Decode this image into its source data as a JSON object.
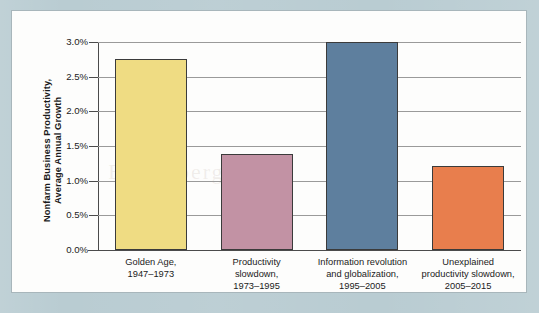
{
  "chart_data": {
    "type": "bar",
    "title": "",
    "xlabel": "",
    "ylabel": "Nonfarm Business Productivity, Average Annual Growth",
    "ylabel_lines": [
      "Nonfarm Business Productivity,",
      "Average Annual Growth"
    ],
    "categories": [
      "Golden Age, 1947–1973",
      "Productivity slowdown, 1973–1995",
      "Information revolution and globalization, 1995–2005",
      "Unexplained productivity slowdown, 2005–2015"
    ],
    "category_lines": [
      [
        "Golden Age,",
        "1947–1973"
      ],
      [
        "Productivity",
        "slowdown,",
        "1973–1995"
      ],
      [
        "Information revolution",
        "and globalization,",
        "1995–2005"
      ],
      [
        "Unexplained",
        "productivity slowdown,",
        "2005–2015"
      ]
    ],
    "values": [
      2.75,
      1.38,
      3.0,
      1.21
    ],
    "value_unit": "%",
    "ylim": [
      0.0,
      3.0
    ],
    "ytick_values": [
      0.0,
      0.5,
      1.0,
      1.5,
      2.0,
      2.5,
      3.0
    ],
    "ytick_labels": [
      "0.0%",
      "0.5%",
      "1.0%",
      "1.5%",
      "2.0%",
      "2.5%",
      "3.0%"
    ],
    "grid": true,
    "legend": false,
    "bar_colors": [
      "#efdc83",
      "#c292a4",
      "#5e7f9e",
      "#e87e4d"
    ],
    "bar_outline_color": "#3b3b3b"
  },
  "figure": {
    "frame_color": "#b9ccd2",
    "panel_color": "#fdfdfc",
    "panel_border_color": "#a8b6bb",
    "axis_color": "#4b4b4b",
    "gridline_color": "#9a9a9a",
    "text_color": "#1b1b1b",
    "watermark_text": "Bloomberg"
  }
}
